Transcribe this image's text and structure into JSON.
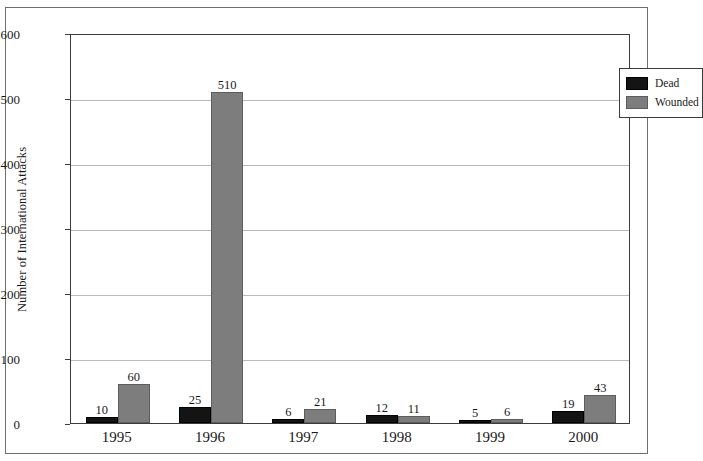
{
  "figure": {
    "title_partial": "",
    "frame": "scanned-page-border"
  },
  "chart_data": {
    "type": "bar",
    "title": "",
    "xlabel": "",
    "ylabel": "Number of International Attacks",
    "categories": [
      "1995",
      "1996",
      "1997",
      "1998",
      "1999",
      "2000"
    ],
    "series": [
      {
        "name": "Dead",
        "color": "#141414",
        "values": [
          10,
          25,
          6,
          12,
          5,
          19
        ]
      },
      {
        "name": "Wounded",
        "color": "#7d7d7d",
        "values": [
          60,
          510,
          21,
          11,
          6,
          43
        ]
      }
    ],
    "ylim": [
      0,
      600
    ],
    "yticks": [
      0,
      100,
      200,
      300,
      400,
      500,
      600
    ],
    "ytick_labels": [
      "0",
      "100",
      "200",
      "300",
      "400",
      "500",
      "600"
    ],
    "grid": true,
    "grid_axis": "y",
    "legend_position": "top-right",
    "legend_entries": [
      "Dead",
      "Wounded"
    ],
    "bar_labels_shown": true
  }
}
